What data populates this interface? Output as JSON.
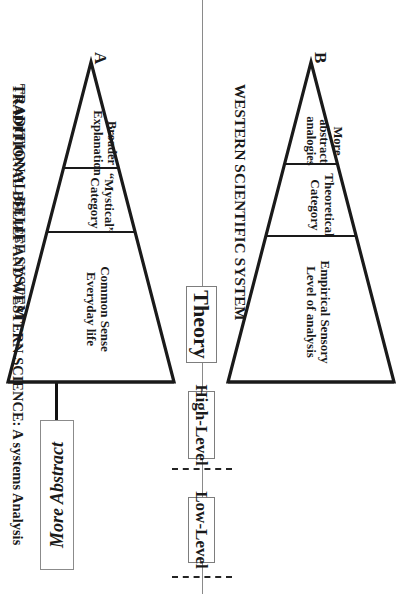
{
  "figure": {
    "caption": "TRADITIONAL BELIEF AND WESTERN SCIENCE:  A systems Analysis",
    "orientation_note": "rotated",
    "divider_color": "#8a8a8a",
    "ink_color": "#1a1a1a"
  },
  "abstraction_arrow": {
    "label": "More Abstract",
    "direction": "left",
    "upside_down": true
  },
  "axis_labels": [
    {
      "id": "theory",
      "text": "Theory"
    },
    {
      "id": "high_level",
      "text": "High-Level"
    },
    {
      "id": "low_level",
      "text": "Low-Level"
    }
  ],
  "systems": [
    {
      "id": "traditional",
      "apex_letter": "A",
      "caption": "TRADITIONAL BELIEF SYSTEM",
      "tiers": [
        {
          "id": "a-tier-1",
          "lines": [
            "Broader",
            "Explanation"
          ]
        },
        {
          "id": "a-tier-2",
          "lines": [
            "“Mystical”",
            "Category"
          ]
        },
        {
          "id": "a-tier-3",
          "lines": [
            "Common Sense",
            "Everyday life"
          ]
        }
      ]
    },
    {
      "id": "western",
      "apex_letter": "B",
      "caption": "WESTERN SCIENTIFIC SYSTEM",
      "tiers": [
        {
          "id": "b-tier-1",
          "lines": [
            "More",
            "abstract",
            "analogies"
          ]
        },
        {
          "id": "b-tier-2",
          "lines": [
            "Theoretical",
            "Category"
          ]
        },
        {
          "id": "b-tier-3",
          "lines": [
            "Empirical Sensory",
            "Level of analysis"
          ]
        }
      ]
    }
  ]
}
